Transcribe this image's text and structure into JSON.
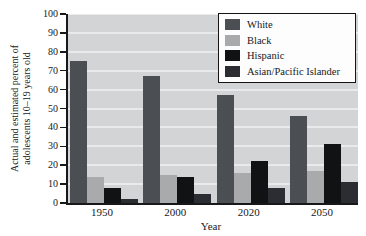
{
  "chart_data": {
    "type": "bar",
    "title": "",
    "categories": [
      "1950",
      "2000",
      "2020",
      "2050"
    ],
    "series": [
      {
        "name": "White",
        "color": "#4b4e53",
        "values": [
          75,
          67,
          57,
          46
        ]
      },
      {
        "name": "Black",
        "color": "#a8aaab",
        "values": [
          14,
          15,
          16,
          17
        ]
      },
      {
        "name": "Hispanic",
        "color": "#111214",
        "values": [
          8,
          14,
          22,
          31
        ]
      },
      {
        "name": "Asian/Pacific Islander",
        "color": "#2b2d33",
        "values": [
          2,
          5,
          8,
          11
        ]
      }
    ],
    "xlabel": "Year",
    "ylabel_line1": "Actual and estimated percent of",
    "ylabel_line2": "adolescents 10–19 years old",
    "ylim": [
      0,
      100
    ],
    "ytick_interval": 10,
    "grid": true,
    "legend_position": "top-right",
    "legend_bg_color": "#fdfdfd",
    "legend_border_color": "#141414",
    "plot_bg_color": "#d3d4d5",
    "gridline_color": "#e9eaeb",
    "axis_color": "#17181a",
    "text_color": "#17181a"
  }
}
